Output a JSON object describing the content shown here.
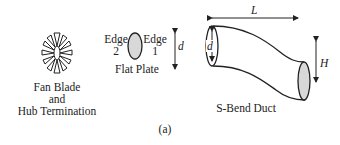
{
  "figure": {
    "caption": "(a)",
    "panels": [
      {
        "id": "fan-blade",
        "label_lines": [
          "Fan Blade",
          "and",
          "Hub Termination"
        ]
      },
      {
        "id": "flat-plate",
        "label": "Flat Plate",
        "edge_left": {
          "word": "Edge",
          "num": "2"
        },
        "edge_right": {
          "word": "Edge",
          "num": "1"
        },
        "dimension": "d"
      },
      {
        "id": "s-bend-duct",
        "label": "S-Bend Duct",
        "dimensions": {
          "length": "L",
          "diameter": "d",
          "offset": "H"
        }
      }
    ]
  },
  "colors": {
    "line": "#222222",
    "fill": "#d8d8d8",
    "background": "#ffffff"
  }
}
